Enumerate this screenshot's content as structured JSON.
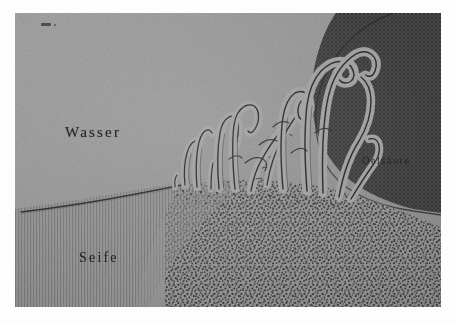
{
  "figure": {
    "plate_mark": "2.",
    "medium": "halftone-engraving-scan",
    "background_color": "#9b9b9b"
  },
  "labels": {
    "water": "Wasser",
    "soap": "Seife",
    "oleic_acid": "Oelsäure"
  },
  "regions": [
    {
      "name": "water",
      "label": "Wasser",
      "color": "#9b9b9b",
      "texture": "smooth-halftone"
    },
    {
      "name": "soap",
      "label": "Seife",
      "color": "#979797",
      "texture": "vertical-hatching"
    },
    {
      "name": "soap-granular",
      "label": "Seife",
      "color": "#8d8d8d",
      "texture": "dense-stipple"
    },
    {
      "name": "oleic-acid",
      "label": "Oelsäure",
      "color": "#4a4a4a",
      "texture": "cross-hatch-dark"
    }
  ],
  "structures": {
    "name": "myelin-figures",
    "count": 13,
    "description": "tubular myelin figures growing from soap surface into water"
  }
}
